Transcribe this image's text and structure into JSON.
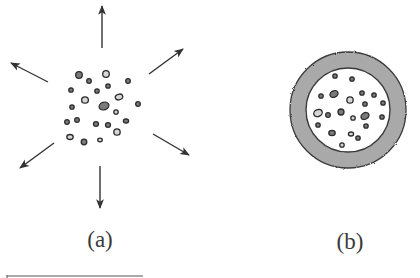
{
  "colors": {
    "ink": "#2b2b2b",
    "arrow": "#333333",
    "particle_fill_dark": "#7a7a7a",
    "particle_fill_light": "#d6d6d6",
    "shell_fill": "#a9a9a9",
    "shell_stroke": "#3a3a3a",
    "background": "#ffffff"
  },
  "panel_a": {
    "label": "(a)",
    "description": "cluster of particles with outward arrows",
    "arrows": [
      {
        "name": "arrow-up",
        "x1": 102,
        "y1": 48,
        "x2": 102,
        "y2": 6
      },
      {
        "name": "arrow-up-left",
        "x1": 48,
        "y1": 82,
        "x2": 11,
        "y2": 63
      },
      {
        "name": "arrow-up-right",
        "x1": 149,
        "y1": 74,
        "x2": 183,
        "y2": 49
      },
      {
        "name": "arrow-down-left",
        "x1": 54,
        "y1": 143,
        "x2": 20,
        "y2": 168
      },
      {
        "name": "arrow-down-right",
        "x1": 153,
        "y1": 134,
        "x2": 189,
        "y2": 155
      },
      {
        "name": "arrow-down",
        "x1": 100,
        "y1": 166,
        "x2": 100,
        "y2": 208
      }
    ],
    "particles": [
      {
        "cx": 79,
        "cy": 75,
        "rx": 3.3,
        "ry": 3.3,
        "fill": "dark"
      },
      {
        "cx": 106,
        "cy": 74,
        "rx": 3.3,
        "ry": 3.3,
        "fill": "light"
      },
      {
        "cx": 89,
        "cy": 81,
        "rx": 2.3,
        "ry": 2.3,
        "fill": "dark"
      },
      {
        "cx": 128,
        "cy": 81,
        "rx": 2.3,
        "ry": 2.3,
        "fill": "dark"
      },
      {
        "cx": 71,
        "cy": 90,
        "rx": 2.2,
        "ry": 2.2,
        "fill": "dark"
      },
      {
        "cx": 97,
        "cy": 91,
        "rx": 2.2,
        "ry": 2.2,
        "fill": "dark"
      },
      {
        "cx": 108,
        "cy": 86,
        "rx": 2.2,
        "ry": 2.2,
        "fill": "dark"
      },
      {
        "cx": 85,
        "cy": 100,
        "rx": 3.4,
        "ry": 3.2,
        "fill": "light"
      },
      {
        "cx": 119,
        "cy": 97,
        "rx": 3.8,
        "ry": 2.8,
        "fill": "light",
        "rotate": -15
      },
      {
        "cx": 104,
        "cy": 106,
        "rx": 5,
        "ry": 3.8,
        "fill": "dark",
        "rotate": -20
      },
      {
        "cx": 72,
        "cy": 107,
        "rx": 2.2,
        "ry": 2.2,
        "fill": "dark"
      },
      {
        "cx": 138,
        "cy": 104,
        "rx": 2.3,
        "ry": 2.3,
        "fill": "dark"
      },
      {
        "cx": 116,
        "cy": 112,
        "rx": 2.2,
        "ry": 2.2,
        "fill": "light"
      },
      {
        "cx": 67,
        "cy": 122,
        "rx": 2.3,
        "ry": 2.3,
        "fill": "dark"
      },
      {
        "cx": 77,
        "cy": 120,
        "rx": 2.3,
        "ry": 2.3,
        "fill": "dark"
      },
      {
        "cx": 96,
        "cy": 124,
        "rx": 2.5,
        "ry": 2.3,
        "fill": "dark"
      },
      {
        "cx": 108,
        "cy": 125,
        "rx": 2.5,
        "ry": 2.3,
        "fill": "dark"
      },
      {
        "cx": 126,
        "cy": 121,
        "rx": 2.6,
        "ry": 2,
        "fill": "dark"
      },
      {
        "cx": 117,
        "cy": 132,
        "rx": 3.2,
        "ry": 3.2,
        "fill": "light"
      },
      {
        "cx": 70,
        "cy": 137,
        "rx": 3.2,
        "ry": 2.5,
        "fill": "light"
      },
      {
        "cx": 84,
        "cy": 142,
        "rx": 2.8,
        "ry": 2.8,
        "fill": "dark"
      },
      {
        "cx": 100,
        "cy": 140,
        "rx": 2.3,
        "ry": 1.8,
        "fill": "light"
      }
    ]
  },
  "panel_b": {
    "label": "(b)",
    "description": "particles enclosed by a thick grey shell",
    "shell": {
      "cx": 348,
      "cy": 110,
      "r_outer": 58,
      "r_inner": 42
    },
    "particles": [
      {
        "cx": 335,
        "cy": 76,
        "rx": 2.2,
        "ry": 2.2,
        "fill": "dark"
      },
      {
        "cx": 352,
        "cy": 79,
        "rx": 2.2,
        "ry": 2.2,
        "fill": "dark"
      },
      {
        "cx": 334,
        "cy": 94,
        "rx": 4.2,
        "ry": 3.2,
        "fill": "dark",
        "rotate": -25
      },
      {
        "cx": 321,
        "cy": 96,
        "rx": 2.2,
        "ry": 2.2,
        "fill": "dark"
      },
      {
        "cx": 362,
        "cy": 93,
        "rx": 2.2,
        "ry": 2.2,
        "fill": "dark"
      },
      {
        "cx": 374,
        "cy": 95,
        "rx": 2.2,
        "ry": 2.2,
        "fill": "dark"
      },
      {
        "cx": 350,
        "cy": 100,
        "rx": 3.2,
        "ry": 3.2,
        "fill": "light"
      },
      {
        "cx": 365,
        "cy": 104,
        "rx": 2.2,
        "ry": 2.2,
        "fill": "dark"
      },
      {
        "cx": 383,
        "cy": 103,
        "rx": 2.2,
        "ry": 2.2,
        "fill": "dark"
      },
      {
        "cx": 318,
        "cy": 113,
        "rx": 4.4,
        "ry": 3.4,
        "fill": "light",
        "rotate": -25
      },
      {
        "cx": 328,
        "cy": 115,
        "rx": 2.3,
        "ry": 2.3,
        "fill": "dark"
      },
      {
        "cx": 341,
        "cy": 112,
        "rx": 3,
        "ry": 3,
        "fill": "dark"
      },
      {
        "cx": 353,
        "cy": 118,
        "rx": 2.2,
        "ry": 2.2,
        "fill": "light"
      },
      {
        "cx": 365,
        "cy": 116,
        "rx": 4.2,
        "ry": 3.2,
        "fill": "dark",
        "rotate": -30
      },
      {
        "cx": 382,
        "cy": 117,
        "rx": 2.2,
        "ry": 2.2,
        "fill": "dark"
      },
      {
        "cx": 318,
        "cy": 125,
        "rx": 2.2,
        "ry": 2.2,
        "fill": "dark"
      },
      {
        "cx": 366,
        "cy": 126,
        "rx": 2.2,
        "ry": 2.2,
        "fill": "dark"
      },
      {
        "cx": 332,
        "cy": 133,
        "rx": 3.2,
        "ry": 2.6,
        "fill": "dark"
      },
      {
        "cx": 351,
        "cy": 134,
        "rx": 2.6,
        "ry": 2,
        "fill": "light"
      },
      {
        "cx": 358,
        "cy": 138,
        "rx": 2.2,
        "ry": 2.2,
        "fill": "dark"
      },
      {
        "cx": 342,
        "cy": 145,
        "rx": 2.2,
        "ry": 2.2,
        "fill": "light"
      }
    ]
  },
  "footnote_rule": {
    "x1": 7,
    "x2": 143,
    "y": 276
  }
}
